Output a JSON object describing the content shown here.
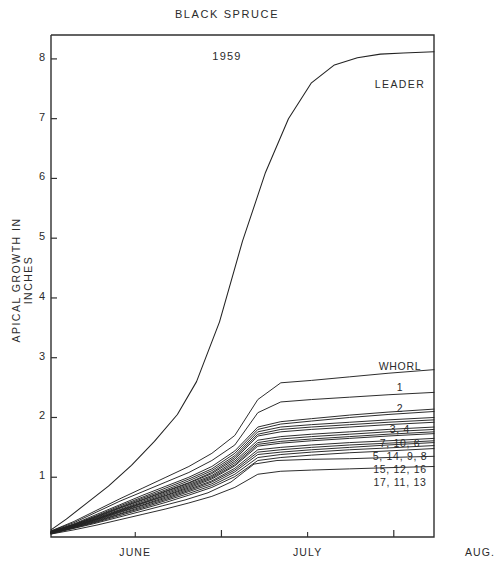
{
  "chart_title": "BLACK SPRUCE",
  "year_label": "1959",
  "axes": {
    "y_title": "APICAL GROWTH IN INCHES",
    "y_ticks": [
      1,
      2,
      3,
      4,
      5,
      6,
      7,
      8
    ],
    "x_ticks": [
      "JUNE",
      "JULY",
      "AUG."
    ]
  },
  "legend": {
    "leader_label": "LEADER",
    "whorl_header": "WHORL",
    "entries": [
      "1",
      "2",
      "3, 4",
      "7, 10, 6",
      "5, 14, 9, 8",
      "15, 12, 16",
      "17, 11, 13"
    ]
  },
  "colors": {
    "ink": "#1a1a1a",
    "axis": "#303030",
    "line": "#222222",
    "background": "#ffffff"
  },
  "chart_data": {
    "type": "line",
    "title": "BLACK SPRUCE",
    "subtitle": "1959",
    "xlabel": "",
    "ylabel": "APICAL GROWTH IN INCHES",
    "ylim": [
      0,
      8.4
    ],
    "xlim": [
      0,
      100
    ],
    "grid": false,
    "legend_position": "right-inside",
    "x_tick_labels": [
      "JUNE",
      "JULY",
      "AUG."
    ],
    "x_tick_positions": [
      22,
      67,
      112
    ],
    "y_tick_values": [
      1,
      2,
      3,
      4,
      5,
      6,
      7,
      8
    ],
    "x_axis_note": "x measured in days from start of record; month labels centered on JUNE, JULY, AUG.",
    "series": [
      {
        "name": "LEADER",
        "label": "LEADER",
        "x": [
          0,
          4,
          9,
          15,
          21,
          27,
          33,
          38,
          44,
          50,
          56,
          62,
          68,
          74,
          80,
          86,
          92,
          100
        ],
        "y": [
          0.12,
          0.3,
          0.55,
          0.85,
          1.2,
          1.6,
          2.05,
          2.6,
          3.6,
          4.95,
          6.1,
          7.0,
          7.6,
          7.9,
          8.02,
          8.08,
          8.1,
          8.12
        ]
      },
      {
        "name": "whorl 1",
        "label": "1",
        "x": [
          0,
          6,
          12,
          18,
          24,
          30,
          36,
          42,
          48,
          54,
          60,
          68,
          78,
          88,
          100
        ],
        "y": [
          0.1,
          0.26,
          0.45,
          0.64,
          0.82,
          1.0,
          1.18,
          1.4,
          1.7,
          2.3,
          2.58,
          2.62,
          2.68,
          2.74,
          2.8
        ]
      },
      {
        "name": "whorl 2",
        "label": "2",
        "x": [
          0,
          6,
          12,
          18,
          24,
          30,
          36,
          42,
          48,
          54,
          60,
          68,
          78,
          88,
          100
        ],
        "y": [
          0.1,
          0.24,
          0.42,
          0.6,
          0.76,
          0.92,
          1.08,
          1.28,
          1.54,
          2.08,
          2.26,
          2.3,
          2.34,
          2.38,
          2.42
        ]
      },
      {
        "name": "whorl 3",
        "label": "3",
        "x": [
          0,
          6,
          12,
          18,
          24,
          30,
          36,
          42,
          48,
          54,
          60,
          68,
          78,
          88,
          100
        ],
        "y": [
          0.09,
          0.22,
          0.38,
          0.54,
          0.7,
          0.85,
          1.0,
          1.18,
          1.44,
          1.84,
          1.93,
          1.98,
          2.04,
          2.09,
          2.14
        ]
      },
      {
        "name": "whorl 4",
        "label": "4",
        "x": [
          0,
          6,
          12,
          18,
          24,
          30,
          36,
          42,
          48,
          54,
          60,
          68,
          78,
          88,
          100
        ],
        "y": [
          0.09,
          0.21,
          0.36,
          0.52,
          0.67,
          0.82,
          0.97,
          1.14,
          1.4,
          1.8,
          1.89,
          1.94,
          2.0,
          2.05,
          2.1
        ]
      },
      {
        "name": "whorl 7",
        "label": "7",
        "x": [
          0,
          6,
          12,
          18,
          24,
          30,
          36,
          42,
          48,
          54,
          60,
          68,
          78,
          88,
          100
        ],
        "y": [
          0.09,
          0.21,
          0.35,
          0.5,
          0.65,
          0.79,
          0.94,
          1.11,
          1.36,
          1.76,
          1.84,
          1.88,
          1.92,
          1.96,
          2.0
        ]
      },
      {
        "name": "whorl 10",
        "label": "10",
        "x": [
          0,
          6,
          12,
          18,
          24,
          30,
          36,
          42,
          48,
          54,
          60,
          68,
          78,
          88,
          100
        ],
        "y": [
          0.08,
          0.2,
          0.34,
          0.49,
          0.63,
          0.77,
          0.91,
          1.08,
          1.33,
          1.72,
          1.8,
          1.84,
          1.88,
          1.92,
          1.96
        ]
      },
      {
        "name": "whorl 6",
        "label": "6",
        "x": [
          0,
          6,
          12,
          18,
          24,
          30,
          36,
          42,
          48,
          54,
          60,
          68,
          78,
          88,
          100
        ],
        "y": [
          0.08,
          0.2,
          0.33,
          0.48,
          0.62,
          0.76,
          0.9,
          1.06,
          1.3,
          1.69,
          1.76,
          1.8,
          1.84,
          1.88,
          1.92
        ]
      },
      {
        "name": "whorl 5",
        "label": "5",
        "x": [
          0,
          6,
          12,
          18,
          24,
          30,
          36,
          42,
          48,
          54,
          60,
          68,
          78,
          88,
          100
        ],
        "y": [
          0.08,
          0.19,
          0.32,
          0.46,
          0.6,
          0.74,
          0.88,
          1.03,
          1.27,
          1.62,
          1.68,
          1.72,
          1.76,
          1.8,
          1.84
        ]
      },
      {
        "name": "whorl 14",
        "label": "14",
        "x": [
          0,
          6,
          12,
          18,
          24,
          30,
          36,
          42,
          48,
          54,
          60,
          68,
          78,
          88,
          100
        ],
        "y": [
          0.08,
          0.19,
          0.31,
          0.45,
          0.58,
          0.72,
          0.86,
          1.01,
          1.24,
          1.58,
          1.64,
          1.68,
          1.72,
          1.76,
          1.8
        ]
      },
      {
        "name": "whorl 9",
        "label": "9",
        "x": [
          0,
          6,
          12,
          18,
          24,
          30,
          36,
          42,
          48,
          54,
          60,
          68,
          78,
          88,
          100
        ],
        "y": [
          0.07,
          0.18,
          0.3,
          0.44,
          0.57,
          0.7,
          0.84,
          0.99,
          1.21,
          1.55,
          1.6,
          1.64,
          1.68,
          1.72,
          1.76
        ]
      },
      {
        "name": "whorl 8",
        "label": "8",
        "x": [
          0,
          6,
          12,
          18,
          24,
          30,
          36,
          42,
          48,
          54,
          60,
          68,
          78,
          88,
          100
        ],
        "y": [
          0.07,
          0.18,
          0.3,
          0.43,
          0.56,
          0.69,
          0.82,
          0.97,
          1.19,
          1.52,
          1.57,
          1.61,
          1.65,
          1.69,
          1.73
        ]
      },
      {
        "name": "whorl 15",
        "label": "15",
        "x": [
          0,
          6,
          12,
          18,
          24,
          30,
          36,
          42,
          48,
          54,
          60,
          68,
          78,
          88,
          100
        ],
        "y": [
          0.07,
          0.17,
          0.29,
          0.42,
          0.54,
          0.67,
          0.8,
          0.94,
          1.15,
          1.46,
          1.5,
          1.54,
          1.58,
          1.61,
          1.65
        ]
      },
      {
        "name": "whorl 12",
        "label": "12",
        "x": [
          0,
          6,
          12,
          18,
          24,
          30,
          36,
          42,
          48,
          54,
          60,
          68,
          78,
          88,
          100
        ],
        "y": [
          0.07,
          0.17,
          0.28,
          0.41,
          0.53,
          0.65,
          0.78,
          0.92,
          1.12,
          1.42,
          1.46,
          1.5,
          1.54,
          1.57,
          1.61
        ]
      },
      {
        "name": "whorl 16",
        "label": "16",
        "x": [
          0,
          6,
          12,
          18,
          24,
          30,
          36,
          42,
          48,
          54,
          60,
          68,
          78,
          88,
          100
        ],
        "y": [
          0.06,
          0.16,
          0.27,
          0.39,
          0.51,
          0.63,
          0.76,
          0.89,
          1.09,
          1.38,
          1.42,
          1.46,
          1.5,
          1.54,
          1.58
        ]
      },
      {
        "name": "whorl 17",
        "label": "17",
        "x": [
          0,
          6,
          12,
          18,
          24,
          30,
          36,
          42,
          48,
          54,
          60,
          68,
          78,
          88,
          100
        ],
        "y": [
          0.06,
          0.16,
          0.26,
          0.38,
          0.49,
          0.61,
          0.73,
          0.86,
          1.05,
          1.33,
          1.38,
          1.42,
          1.46,
          1.49,
          1.53
        ]
      },
      {
        "name": "whorl 11",
        "label": "11",
        "x": [
          0,
          6,
          12,
          18,
          24,
          30,
          36,
          42,
          48,
          54,
          60,
          68,
          78,
          88,
          100
        ],
        "y": [
          0.06,
          0.15,
          0.25,
          0.36,
          0.47,
          0.58,
          0.7,
          0.83,
          1.01,
          1.28,
          1.33,
          1.37,
          1.41,
          1.44,
          1.48
        ]
      },
      {
        "name": "whorl 13",
        "label": "13",
        "x": [
          0,
          5,
          11,
          17,
          23,
          29,
          35,
          41,
          47,
          53,
          59,
          68,
          78,
          88,
          100
        ],
        "y": [
          0.05,
          0.13,
          0.22,
          0.32,
          0.42,
          0.52,
          0.62,
          0.74,
          0.92,
          1.22,
          1.28,
          1.3,
          1.31,
          1.33,
          1.35
        ]
      },
      {
        "name": "whorl low",
        "label": "",
        "x": [
          0,
          6,
          12,
          18,
          24,
          30,
          36,
          42,
          48,
          54,
          60,
          68,
          78,
          88,
          100
        ],
        "y": [
          0.05,
          0.12,
          0.2,
          0.29,
          0.38,
          0.47,
          0.57,
          0.68,
          0.83,
          1.05,
          1.1,
          1.12,
          1.14,
          1.16,
          1.18
        ]
      }
    ]
  }
}
